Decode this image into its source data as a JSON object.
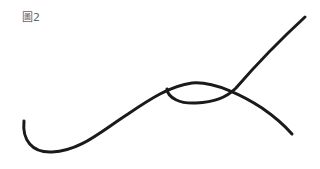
{
  "figure": {
    "label": "圖2",
    "stroke_color": "#1a1a1a",
    "curves": [
      {
        "name": "long-wave-curve",
        "path": "M 24 121 C 22 140, 32 153, 52 152 C 80 151, 100 132, 128 114 C 150 99, 170 86, 192 83 C 215 81, 245 97, 262 108 C 275 117, 285 126, 292 134"
      },
      {
        "name": "loop-rising-curve",
        "path": "M 167 89 C 168 98, 180 104, 196 103 C 214 102, 226 98, 236 88 C 255 66, 280 40, 305 17"
      }
    ]
  }
}
